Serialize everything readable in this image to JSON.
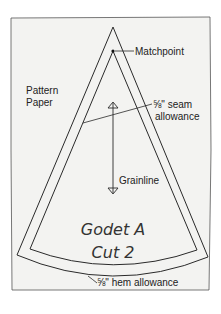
{
  "diagram": {
    "paper_label": [
      "Pattern",
      "Paper"
    ],
    "matchpoint_label": "Matchpoint",
    "seam_allowance_label": [
      "⅝\" seam",
      "allowance"
    ],
    "grainline_label": "Grainline",
    "piece_name": "Godet A",
    "cut_instruction": "Cut 2",
    "hem_allowance_label": "⅝\" hem allowance",
    "colors": {
      "paper": "#f3f3f1",
      "line": "#2a2a2a",
      "background": "#ffffff"
    }
  }
}
